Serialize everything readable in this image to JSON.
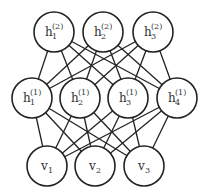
{
  "layers": [
    {
      "name": "hidden-2",
      "nodes": [
        {
          "id": "h2_1",
          "base": "h",
          "sub": "1",
          "sup": "(2)",
          "cx": 54,
          "cy": 32
        },
        {
          "id": "h2_2",
          "base": "h",
          "sub": "2",
          "sup": "(2)",
          "cx": 103,
          "cy": 32
        },
        {
          "id": "h2_3",
          "base": "h",
          "sub": "3",
          "sup": "(2)",
          "cx": 153,
          "cy": 32
        }
      ]
    },
    {
      "name": "hidden-1",
      "nodes": [
        {
          "id": "h1_1",
          "base": "h",
          "sub": "1",
          "sup": "(1)",
          "cx": 32,
          "cy": 98
        },
        {
          "id": "h1_2",
          "base": "h",
          "sub": "2",
          "sup": "(1)",
          "cx": 80,
          "cy": 98
        },
        {
          "id": "h1_3",
          "base": "h",
          "sub": "3",
          "sup": "(1)",
          "cx": 128,
          "cy": 98
        },
        {
          "id": "h1_4",
          "base": "h",
          "sub": "4",
          "sup": "(1)",
          "cx": 177,
          "cy": 98
        }
      ]
    },
    {
      "name": "visible",
      "nodes": [
        {
          "id": "v_1",
          "base": "v",
          "sub": "1",
          "sup": "",
          "cx": 47,
          "cy": 166
        },
        {
          "id": "v_2",
          "base": "v",
          "sub": "2",
          "sup": "",
          "cx": 95,
          "cy": 166
        },
        {
          "id": "v_3",
          "base": "v",
          "sub": "3",
          "sup": "",
          "cx": 144,
          "cy": 166
        }
      ]
    }
  ],
  "radius": 20,
  "connectivity": "fully-connected between adjacent layers"
}
